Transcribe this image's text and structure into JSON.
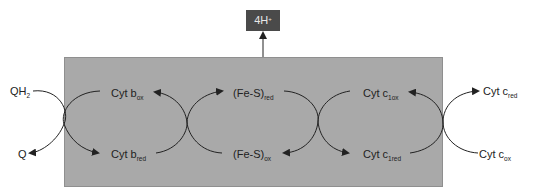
{
  "diagram": {
    "proton_box": {
      "base": "4H",
      "sup": "+"
    },
    "colors": {
      "membrane": "#a9a9a9",
      "proton_box": "#4a4a4a",
      "proton_text": "#e8e8e8",
      "lines": "#222222"
    },
    "labels": {
      "qh2": {
        "base": "QH",
        "sub": "2"
      },
      "q": {
        "base": "Q",
        "sub": ""
      },
      "cyt_b_ox": {
        "base": "Cyt b",
        "sub": "ox"
      },
      "cyt_b_red": {
        "base": "Cyt b",
        "sub": "red"
      },
      "fes_red": {
        "base": "(Fe-S)",
        "sub": "red"
      },
      "fes_ox": {
        "base": "(Fe-S)",
        "sub": "ox"
      },
      "cyt_c1_ox": {
        "base": "Cyt c",
        "sub": "1ox"
      },
      "cyt_c1_red": {
        "base": "Cyt c",
        "sub": "1red"
      },
      "cyt_c_red": {
        "base": "Cyt c",
        "sub": "red"
      },
      "cyt_c_ox": {
        "base": "Cyt c",
        "sub": "ox"
      }
    }
  }
}
